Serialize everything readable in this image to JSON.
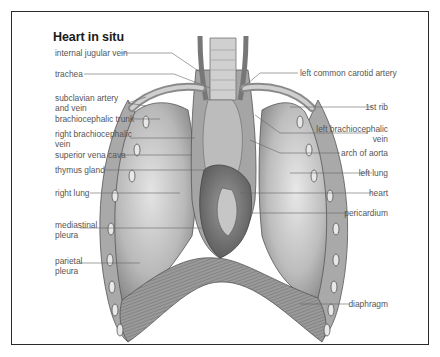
{
  "figure": {
    "title": "Heart in situ",
    "labels_left": [
      {
        "id": "internal-jugular-vein",
        "text": "internal jugular vein"
      },
      {
        "id": "trachea",
        "text": "trachea"
      },
      {
        "id": "subclavian-artery-and-vein",
        "line1": "subclavian artery",
        "line2": "and vein"
      },
      {
        "id": "brachiocephalic-trunk",
        "text": "brachiocephalic trunk"
      },
      {
        "id": "right-brachiocephalic-vein",
        "line1": "right brachiocephalic",
        "line2": "vein"
      },
      {
        "id": "superior-vena-cava",
        "text": "superior vena cava"
      },
      {
        "id": "thymus-gland",
        "text": "thymus gland"
      },
      {
        "id": "right-lung",
        "text": "right lung"
      },
      {
        "id": "mediastinal-pleura",
        "line1": "mediastinal",
        "line2": "pleura"
      },
      {
        "id": "parietal-pleura",
        "line1": "parietal",
        "line2": "pleura"
      }
    ],
    "labels_right": [
      {
        "id": "left-common-carotid-artery",
        "text": "left common carotid artery"
      },
      {
        "id": "1st-rib",
        "text": "1st rib"
      },
      {
        "id": "left-brachiocephalic-vein",
        "line1": "left brachiocephalic",
        "line2": "vein"
      },
      {
        "id": "arch-of-aorta",
        "text": "arch of aorta"
      },
      {
        "id": "left-lung",
        "text": "left lung"
      },
      {
        "id": "heart",
        "text": "heart"
      },
      {
        "id": "pericardium",
        "text": "pericardium"
      },
      {
        "id": "diaphragm",
        "text": "diaphragm"
      }
    ]
  }
}
